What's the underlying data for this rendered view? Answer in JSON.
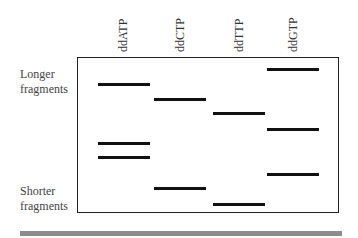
{
  "lanes": [
    {
      "label": "ddATP",
      "x": 98
    },
    {
      "label": "ddCTP",
      "x": 154
    },
    {
      "label": "ddTTP",
      "x": 213
    },
    {
      "label": "ddGTP",
      "x": 267
    }
  ],
  "side_labels": {
    "top": [
      "Longer",
      "fragments"
    ],
    "bottom": [
      "Shorter",
      "fragments"
    ]
  },
  "bands": [
    {
      "lane": "ddGTP",
      "y": 69
    },
    {
      "lane": "ddATP",
      "y": 84
    },
    {
      "lane": "ddCTP",
      "y": 99
    },
    {
      "lane": "ddTTP",
      "y": 113
    },
    {
      "lane": "ddGTP",
      "y": 129
    },
    {
      "lane": "ddATP",
      "y": 143
    },
    {
      "lane": "ddATP",
      "y": 157
    },
    {
      "lane": "ddGTP",
      "y": 174
    },
    {
      "lane": "ddCTP",
      "y": 188
    },
    {
      "lane": "ddTTP",
      "y": 204
    }
  ],
  "colors": {
    "band": "#111111",
    "border": "#222222",
    "bar": "#8c8c8c"
  }
}
